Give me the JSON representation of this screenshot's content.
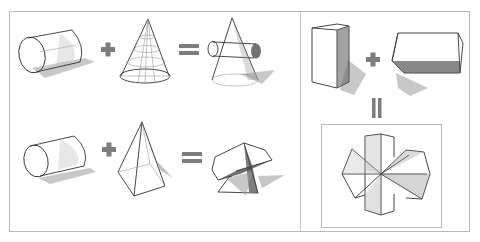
{
  "figure": {
    "panels": [
      {
        "id": "left-top",
        "equation": [
          "cylinder",
          "plus",
          "cone",
          "equals",
          "cylinder-through-cone"
        ]
      },
      {
        "id": "left-bottom",
        "equation": [
          "cylinder",
          "plus",
          "pyramid",
          "equals",
          "intersecting-prisms"
        ]
      },
      {
        "id": "right",
        "equation": [
          "vertical-box",
          "plus",
          "horizontal-box",
          "equals",
          "cross-prism-solid"
        ]
      }
    ],
    "operators": {
      "plus": "+",
      "equals": "="
    },
    "colors": {
      "operator": "#7d7d7d",
      "frame": "#b9b9b9",
      "line": "#333333",
      "background": "#ffffff"
    }
  }
}
